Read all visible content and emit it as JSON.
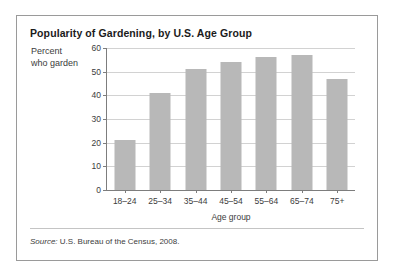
{
  "figure": {
    "title": "Popularity of Gardening, by U.S. Age Group",
    "ylabel_line1": "Percent",
    "ylabel_line2": "who garden",
    "xlabel": "Age group",
    "source_prefix": "Source:",
    "source_text": " U.S. Bureau of the Census, 2008."
  },
  "colors": {
    "bar_fill": "#b8b8b8",
    "grid": "#d2d2d2",
    "axis": "#7d7d7d",
    "frame": "#9a9a9a",
    "text": "#3c3c3c",
    "title_text": "#1b1b1b",
    "background": "#ffffff"
  },
  "chart_data": {
    "type": "bar",
    "title": "Popularity of Gardening, by U.S. Age Group",
    "xlabel": "Age group",
    "ylabel": "Percent who garden",
    "categories": [
      "18–24",
      "25–34",
      "35–44",
      "45–54",
      "55–64",
      "65–74",
      "75+"
    ],
    "values": [
      21,
      41,
      51,
      54,
      56,
      57,
      47
    ],
    "ylim": [
      0,
      60
    ],
    "yticks": [
      0,
      10,
      20,
      30,
      40,
      50,
      60
    ],
    "ytick_labels": [
      "0",
      "10",
      "20",
      "30",
      "40",
      "50",
      "60"
    ],
    "grid": true,
    "legend": false,
    "series": [
      {
        "name": "Percent who garden",
        "values": [
          21,
          41,
          51,
          54,
          56,
          57,
          47
        ]
      }
    ],
    "source": "Source: U.S. Bureau of the Census, 2008."
  }
}
